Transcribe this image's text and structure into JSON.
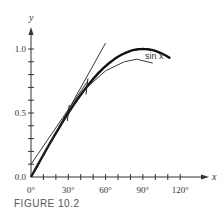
{
  "figure": {
    "caption": "FIGURE 10.2"
  },
  "chart_data": {
    "type": "line",
    "title": "",
    "xlabel": "x",
    "ylabel": "y",
    "x_ticks": [
      "0°",
      "30°",
      "60°",
      "90°",
      "120°"
    ],
    "y_ticks": [
      "0.0",
      "0.5",
      "1.0"
    ],
    "x_range_deg": [
      0,
      130
    ],
    "y_range": [
      0,
      1.15
    ],
    "x_minor_tick_step_deg": 10,
    "y_minor_tick_step": 0.1,
    "grid": false,
    "legend": null,
    "annotations": [
      {
        "text": "sin x",
        "near": "end of thick curve, ~100°"
      }
    ],
    "series": [
      {
        "name": "sin x",
        "style": "thick",
        "x_deg": [
          0,
          15,
          30,
          45,
          60,
          75,
          90,
          105,
          112
        ],
        "y": [
          0,
          0.259,
          0.5,
          0.707,
          0.866,
          0.966,
          1.0,
          0.966,
          0.927
        ]
      },
      {
        "name": "approximation (below sin x)",
        "style": "thin",
        "x_deg": [
          0,
          15,
          30,
          45,
          60,
          75,
          85,
          98
        ],
        "y": [
          0,
          0.259,
          0.5,
          0.7,
          0.83,
          0.9,
          0.92,
          0.89
        ]
      },
      {
        "name": "tangent line y = x",
        "style": "thin",
        "x_deg": [
          0,
          60
        ],
        "y": [
          0,
          1.047
        ]
      },
      {
        "name": "tangent line (offset)",
        "style": "thin",
        "x_deg": [
          0,
          45
        ],
        "y": [
          0.1,
          0.74
        ]
      }
    ],
    "curve_marks_deg": [
      30,
      45
    ]
  }
}
